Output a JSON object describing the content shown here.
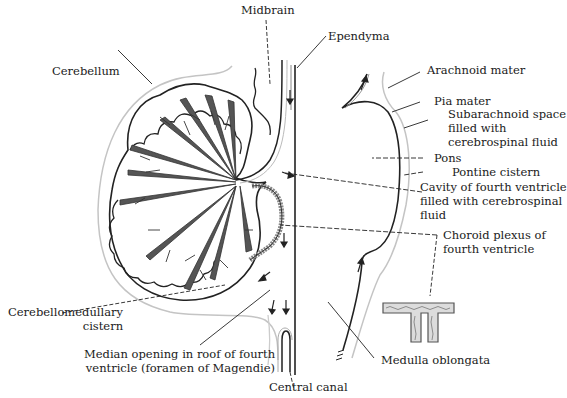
{
  "diagram": {
    "labels": {
      "midbrain": "Midbrain",
      "ependyma": "Ependyma",
      "cerebellum": "Cerebellum",
      "arachnoid_mater": "Arachnoid mater",
      "pia_mater": "Pia mater",
      "subarachnoid_space": "Subarachnoid space\nfilled with\ncerebrospinal fluid",
      "pons": "Pons",
      "pontine_cistern": "Pontine cistern",
      "cavity_fourth_ventricle": "Cavity of fourth ventricle\nfilled with cerebrospinal\nfluid",
      "choroid_plexus": "Choroid plexus of\nfourth ventricle",
      "cerebellomedullary_cistern": "Cerebellomedullary\ncistern",
      "median_opening": "Median opening in roof of fourth\nventricle (foramen of Magendie)",
      "central_canal": "Central canal",
      "medulla_oblongata": "Medulla oblongata"
    },
    "colors": {
      "ink": "#1a1a1a",
      "folia_fill": "#555555",
      "membrane": "#bdbdbd",
      "background": "#ffffff"
    },
    "icons": [
      "flow-arrow-icon",
      "choroid-plexus-inset-icon"
    ]
  }
}
